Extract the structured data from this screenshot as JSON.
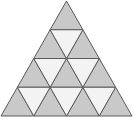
{
  "diagram": {
    "type": "subdivided-triangle",
    "rows": 4,
    "total_small_triangles": 16,
    "upward_count": 10,
    "downward_count": 6,
    "colors": {
      "upward_fill": "#c9c9c9",
      "downward_fill": "#f3f3f3",
      "stroke": "#5a5a5a",
      "background": "#ffffff"
    }
  }
}
